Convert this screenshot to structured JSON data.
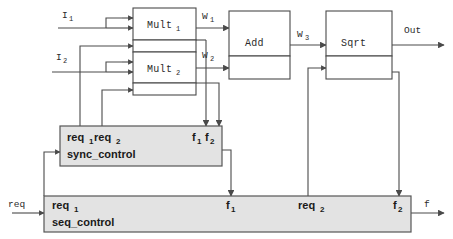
{
  "diagram": {
    "colors": {
      "line": "#4a4a4a",
      "block_fill": "#ffffff",
      "control_fill": "#e3e3e3",
      "control_stroke": "#555555",
      "text": "#1a1a1a"
    },
    "datapath_blocks": [
      {
        "id": "mult1",
        "label": "Mult",
        "sub": "1"
      },
      {
        "id": "mult2",
        "label": "Mult",
        "sub": "2"
      },
      {
        "id": "add",
        "label": "Add",
        "sub": ""
      },
      {
        "id": "sqrt",
        "label": "Sqrt",
        "sub": ""
      }
    ],
    "inputs": [
      {
        "id": "i1",
        "label": "I",
        "sub": "1"
      },
      {
        "id": "i2",
        "label": "I",
        "sub": "2"
      }
    ],
    "outputs": [
      {
        "id": "out",
        "label": "Out",
        "sub": ""
      }
    ],
    "signals": [
      {
        "id": "w1",
        "label": "W",
        "sub": "1"
      },
      {
        "id": "w2",
        "label": "W",
        "sub": "2"
      },
      {
        "id": "w3",
        "label": "W",
        "sub": "3"
      }
    ],
    "sync_control": {
      "name": "sync_control",
      "ports_in": [
        {
          "id": "sync-req1",
          "label": "req",
          "sub": "1"
        },
        {
          "id": "sync-req2",
          "label": "req",
          "sub": "2"
        }
      ],
      "ports_out": [
        {
          "id": "sync-f1",
          "label": "f",
          "sub": "1"
        },
        {
          "id": "sync-f2",
          "label": "f",
          "sub": "2"
        }
      ]
    },
    "seq_control": {
      "name": "seq_control",
      "ports_in": [
        {
          "id": "seq-req1",
          "label": "req",
          "sub": "1"
        }
      ],
      "ports_mid": [
        {
          "id": "seq-f1",
          "label": "f",
          "sub": "1"
        },
        {
          "id": "seq-req2",
          "label": "req",
          "sub": "2"
        }
      ],
      "ports_out": [
        {
          "id": "seq-f2",
          "label": "f",
          "sub": "2"
        }
      ]
    },
    "external_ports": [
      {
        "id": "req-in",
        "label": "req",
        "sub": ""
      },
      {
        "id": "f-out",
        "label": "f",
        "sub": ""
      }
    ]
  }
}
